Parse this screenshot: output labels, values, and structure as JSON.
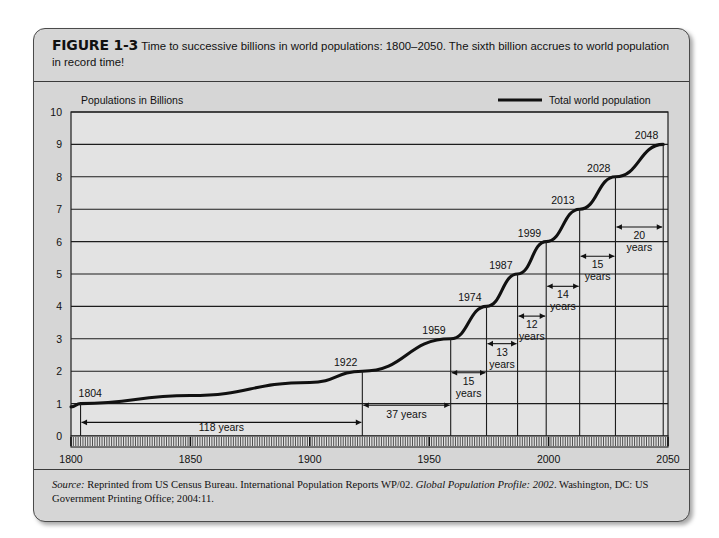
{
  "figure": {
    "number_label": "FIGURE 1-3",
    "caption": "Time to successive billions in world populations: 1800–2050. The sixth billion accrues to world population in record time!"
  },
  "source": {
    "label": "Source:",
    "part1": " Reprinted from US Census Bureau. International Population Reports WP/02. ",
    "italic1": "Global Population Profile: 2002",
    "part2": ". Washington, DC: US Government Printing Office; 2004:11."
  },
  "chart_data": {
    "type": "line",
    "title": "Time to successive billions in world populations: 1800–2050",
    "plot_header": "Populations in Billions",
    "xlabel": "",
    "ylabel": "Populations in Billions",
    "xlim": [
      1800,
      2050
    ],
    "ylim": [
      0,
      10
    ],
    "x_ticks": [
      "1800",
      "1850",
      "1900",
      "1950",
      "2000",
      "2050"
    ],
    "x_tick_values": [
      1800,
      1850,
      1900,
      1950,
      2000,
      2050
    ],
    "y_ticks": [
      "0",
      "1",
      "2",
      "3",
      "4",
      "5",
      "6",
      "7",
      "8",
      "9",
      "10"
    ],
    "y_tick_values": [
      0,
      1,
      2,
      3,
      4,
      5,
      6,
      7,
      8,
      9,
      10
    ],
    "grid": "horizontal",
    "legend_position": "top-right",
    "legend": [
      {
        "name": "Total world population",
        "color": "#111111"
      }
    ],
    "series": [
      {
        "name": "Total world population",
        "x": [
          1800,
          1804,
          1850,
          1900,
          1922,
          1959,
          1974,
          1987,
          1999,
          2013,
          2028,
          2048
        ],
        "values": [
          0.9,
          1,
          1.25,
          1.65,
          2,
          3,
          4,
          5,
          6,
          7,
          8,
          9
        ]
      }
    ],
    "milestones": [
      {
        "year": 1804,
        "billions": 1,
        "label": "1804"
      },
      {
        "year": 1922,
        "billions": 2,
        "label": "1922"
      },
      {
        "year": 1959,
        "billions": 3,
        "label": "1959"
      },
      {
        "year": 1974,
        "billions": 4,
        "label": "1974"
      },
      {
        "year": 1987,
        "billions": 5,
        "label": "1987"
      },
      {
        "year": 1999,
        "billions": 6,
        "label": "1999"
      },
      {
        "year": 2013,
        "billions": 7,
        "label": "2013"
      },
      {
        "year": 2028,
        "billions": 8,
        "label": "2028"
      },
      {
        "year": 2048,
        "billions": 9,
        "label": "2048"
      }
    ],
    "intervals": [
      {
        "from": 1804,
        "to": 1922,
        "years": 118,
        "label": "118 years",
        "label_lines": [
          "118 years"
        ]
      },
      {
        "from": 1922,
        "to": 1959,
        "years": 37,
        "label": "37 years",
        "label_lines": [
          "37 years"
        ]
      },
      {
        "from": 1959,
        "to": 1974,
        "years": 15,
        "label": "15 years",
        "label_lines": [
          "15",
          "years"
        ]
      },
      {
        "from": 1974,
        "to": 1987,
        "years": 13,
        "label": "13 years",
        "label_lines": [
          "13",
          "years"
        ]
      },
      {
        "from": 1987,
        "to": 1999,
        "years": 12,
        "label": "12 years",
        "label_lines": [
          "12",
          "years"
        ]
      },
      {
        "from": 1999,
        "to": 2013,
        "years": 14,
        "label": "14 years",
        "label_lines": [
          "14",
          "years"
        ]
      },
      {
        "from": 2013,
        "to": 2028,
        "years": 15,
        "label": "15 years",
        "label_lines": [
          "15",
          "years"
        ]
      },
      {
        "from": 2028,
        "to": 2048,
        "years": 20,
        "label": "20 years",
        "label_lines": [
          "20",
          "years"
        ]
      }
    ],
    "colors": {
      "plot_background": "#e3e3e3",
      "panel_background": "#d6d6d6",
      "line": "#111111",
      "grid": "#1d1d1d"
    }
  }
}
